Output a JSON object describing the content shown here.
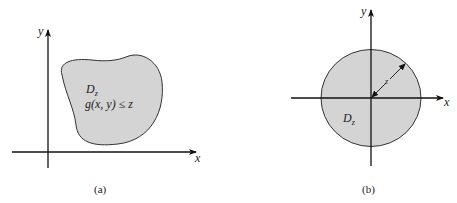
{
  "figure_a": {
    "caption": "(a)",
    "x_axis_label": "x",
    "y_axis_label": "y",
    "region_label": "D",
    "region_label_sub": "z",
    "condition": "g(x, y) ≤ z",
    "region_fill": "#d4d4d4"
  },
  "figure_b": {
    "caption": "(b)",
    "x_axis_label": "x",
    "y_axis_label": "y",
    "region_label": "D",
    "region_label_sub": "z",
    "radius_label": "z",
    "region_fill": "#d4d4d4"
  }
}
